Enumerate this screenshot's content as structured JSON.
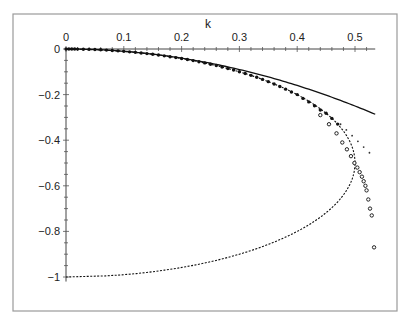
{
  "chart_data": {
    "type": "line",
    "title": "",
    "xlabel": "k",
    "ylabel": "",
    "xlim": [
      0,
      0.535
    ],
    "ylim": [
      -1,
      0
    ],
    "x_axis_position": "top",
    "grid": false,
    "legend": null,
    "x_ticks": [
      "0",
      "0.1",
      "0.2",
      "0.3",
      "0.4",
      "0.5"
    ],
    "x_tick_values": [
      0,
      0.1,
      0.2,
      0.3,
      0.4,
      0.5
    ],
    "y_ticks": [
      "0",
      "-0.2",
      "-0.4",
      "-0.6",
      "-0.8",
      "-1"
    ],
    "y_tick_values": [
      0,
      -0.2,
      -0.4,
      -0.6,
      -0.8,
      -1
    ],
    "series": [
      {
        "name": "solid-curve",
        "style": "solid-line",
        "description": "y = -k^2",
        "x": [
          0,
          0.05,
          0.1,
          0.15,
          0.2,
          0.25,
          0.3,
          0.35,
          0.4,
          0.45,
          0.5,
          0.535
        ],
        "y": [
          0,
          -0.0025,
          -0.01,
          -0.0225,
          -0.04,
          -0.0625,
          -0.09,
          -0.1225,
          -0.16,
          -0.2025,
          -0.25,
          -0.286
        ]
      },
      {
        "name": "dashed-curve",
        "style": "dashed-line",
        "description": "k^2 = -y(1+y), closed semicircle from (0,0) to (0,-1) with nose at (0.5,-0.5)",
        "x": [
          0,
          0.0995,
          0.1987,
          0.2958,
          0.3873,
          0.4583,
          0.4899,
          0.5,
          0.4899,
          0.4583,
          0.4,
          0.3,
          0.2,
          0.1,
          0
        ],
        "y": [
          0,
          -0.01,
          -0.0417,
          -0.1,
          -0.2,
          -0.3,
          -0.4,
          -0.5,
          -0.6,
          -0.7,
          -0.8,
          -0.9,
          -0.9583,
          -0.99,
          -1
        ]
      },
      {
        "name": "filled-dots",
        "style": "filled-markers",
        "x": [
          0,
          0.005,
          0.01,
          0.015,
          0.02,
          0.03,
          0.04,
          0.05,
          0.06,
          0.07,
          0.08,
          0.09,
          0.1,
          0.11,
          0.12,
          0.13,
          0.14,
          0.15,
          0.16,
          0.17,
          0.18,
          0.19,
          0.2,
          0.21,
          0.22,
          0.23,
          0.24,
          0.25,
          0.26,
          0.27,
          0.28,
          0.29,
          0.3,
          0.31,
          0.32,
          0.33,
          0.34,
          0.35,
          0.36,
          0.37,
          0.38,
          0.39,
          0.4,
          0.41,
          0.42,
          0.43,
          0.44,
          0.45,
          0.46,
          0.47
        ],
        "y": [
          0,
          -3e-05,
          -0.0001,
          -0.0002,
          -0.0004,
          -0.0009,
          -0.0016,
          -0.0025,
          -0.0036,
          -0.0049,
          -0.0065,
          -0.0082,
          -0.0102,
          -0.0124,
          -0.0148,
          -0.0174,
          -0.0202,
          -0.0233,
          -0.0266,
          -0.0301,
          -0.0338,
          -0.0378,
          -0.0417,
          -0.0463,
          -0.0509,
          -0.0558,
          -0.0609,
          -0.0669,
          -0.0726,
          -0.0788,
          -0.0853,
          -0.0922,
          -0.1,
          -0.1073,
          -0.1155,
          -0.1242,
          -0.1334,
          -0.1432,
          -0.1535,
          -0.1645,
          -0.1762,
          -0.1888,
          -0.2,
          -0.2166,
          -0.232,
          -0.2488,
          -0.2674,
          -0.2821,
          -0.3043,
          -0.3293
        ]
      },
      {
        "name": "small-dots",
        "style": "small-markers",
        "x": [
          0.475,
          0.485,
          0.495,
          0.505,
          0.515,
          0.525
        ],
        "y": [
          -0.33,
          -0.355,
          -0.38,
          -0.405,
          -0.43,
          -0.455
        ]
      },
      {
        "name": "open-circles",
        "style": "open-circle-markers",
        "x": [
          0.44,
          0.455,
          0.468,
          0.478,
          0.486,
          0.493,
          0.499,
          0.504,
          0.508,
          0.512,
          0.515,
          0.518,
          0.52,
          0.523,
          0.526,
          0.529,
          0.533
        ],
        "y": [
          -0.29,
          -0.33,
          -0.37,
          -0.41,
          -0.44,
          -0.47,
          -0.5,
          -0.52,
          -0.54,
          -0.56,
          -0.58,
          -0.6,
          -0.62,
          -0.66,
          -0.7,
          -0.73,
          -0.87
        ]
      }
    ],
    "colors": {
      "lines": "#111111",
      "frame": "#9a9a9a",
      "background": "#ffffff"
    }
  }
}
